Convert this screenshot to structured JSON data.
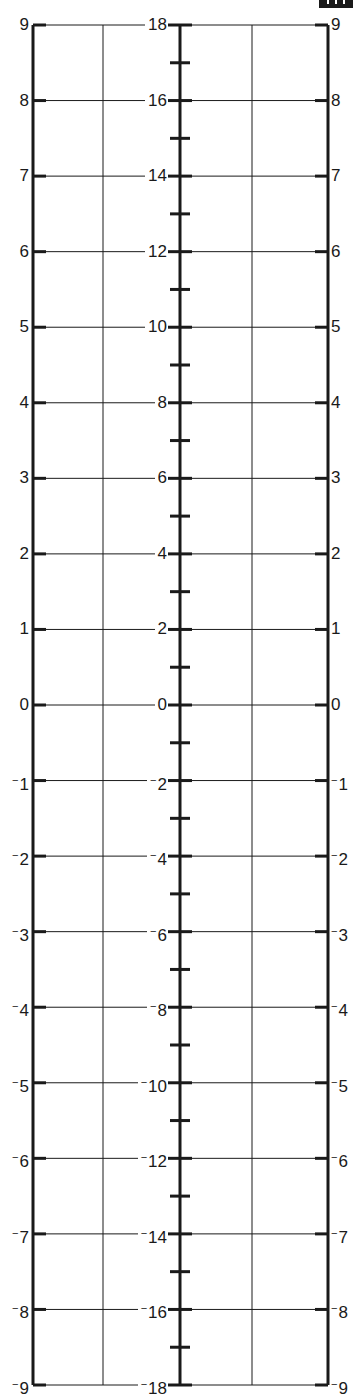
{
  "figure": {
    "type": "nomogram",
    "colors": {
      "line": "#1a1a1a",
      "background": "#ffffff"
    },
    "left_scale": {
      "x": 33,
      "labels": [
        "9",
        "8",
        "7",
        "6",
        "5",
        "4",
        "3",
        "2",
        "1",
        "0",
        "-1",
        "-2",
        "-3",
        "-4",
        "-5",
        "-6",
        "-7",
        "-8",
        "-9"
      ],
      "min": -9,
      "max": 9,
      "step": 1
    },
    "middle_scale": {
      "x": 180,
      "labels": [
        "18",
        "16",
        "14",
        "12",
        "10",
        "8",
        "6",
        "4",
        "2",
        "0",
        "-2",
        "-4",
        "-6",
        "-8",
        "-10",
        "-12",
        "-14",
        "-16",
        "-18"
      ],
      "minor_ticks": "odd values (unlabeled)",
      "min": -18,
      "max": 18,
      "step": 2
    },
    "right_scale": {
      "x": 328,
      "labels": [
        "9",
        "8",
        "7",
        "6",
        "5",
        "4",
        "3",
        "2",
        "1",
        "0",
        "-1",
        "-2",
        "-3",
        "-4",
        "-5",
        "-6",
        "-7",
        "-8",
        "-9"
      ],
      "min": -9,
      "max": 9,
      "step": 1
    },
    "guide_lines_x": [
      103,
      252
    ],
    "top_y": 25,
    "bottom_y": 1385
  },
  "chart_data": {
    "type": "nomogram",
    "title": "",
    "scales": [
      {
        "name": "left",
        "values": [
          9,
          8,
          7,
          6,
          5,
          4,
          3,
          2,
          1,
          0,
          -1,
          -2,
          -3,
          -4,
          -5,
          -6,
          -7,
          -8,
          -9
        ],
        "range": [
          -9,
          9
        ]
      },
      {
        "name": "middle",
        "values": [
          18,
          16,
          14,
          12,
          10,
          8,
          6,
          4,
          2,
          0,
          -2,
          -4,
          -6,
          -8,
          -10,
          -12,
          -14,
          -16,
          -18
        ],
        "minor_ticks": [
          17,
          15,
          13,
          11,
          9,
          7,
          5,
          3,
          1,
          -1,
          -3,
          -5,
          -7,
          -9,
          -11,
          -13,
          -15,
          -17
        ],
        "range": [
          -18,
          18
        ]
      },
      {
        "name": "right",
        "values": [
          9,
          8,
          7,
          6,
          5,
          4,
          3,
          2,
          1,
          0,
          -1,
          -2,
          -3,
          -4,
          -5,
          -6,
          -7,
          -8,
          -9
        ],
        "range": [
          -9,
          9
        ]
      }
    ],
    "relation": "middle = left + right",
    "grid": true,
    "legend": "none"
  }
}
